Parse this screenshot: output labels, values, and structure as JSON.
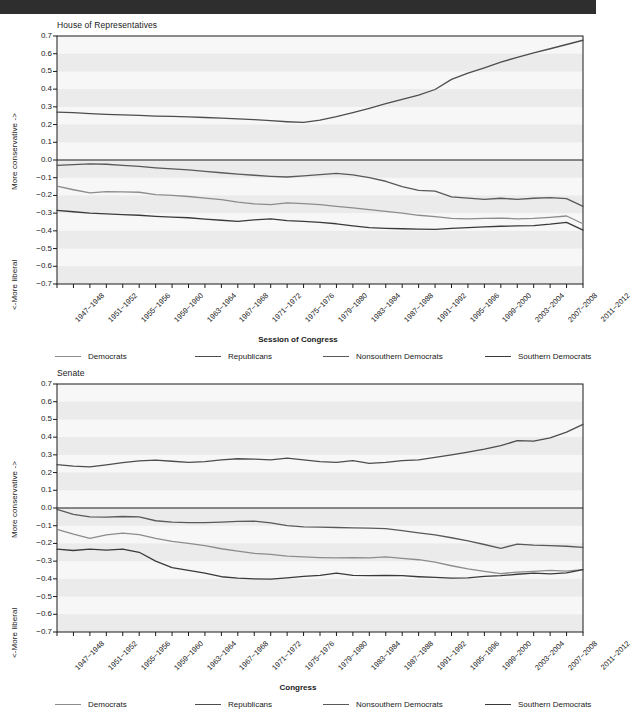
{
  "topbar": {
    "present": true,
    "color": "#2e2e2e"
  },
  "colors": {
    "democrats": "#8c8c8c",
    "republicans": "#4d4d4d",
    "nonsouthern_democrats": "#595959",
    "southern_democrats": "#3a3a3a",
    "axis": "#1a1a1a",
    "band": "#ebebeb",
    "plot_bg": "#f7f7f7"
  },
  "legend": {
    "items": [
      {
        "label": "Democrats",
        "color": "#8c8c8c"
      },
      {
        "label": "Republicans",
        "color": "#4d4d4d"
      },
      {
        "label": "Nonsouthern Democrats",
        "color": "#595959"
      },
      {
        "label": "Southern Democrats",
        "color": "#3a3a3a"
      }
    ]
  },
  "axis_labels": {
    "y_upper": "More conservative ->",
    "y_lower": "<-More liberal",
    "y_ticks": [
      "0.7",
      "0.6",
      "0.5",
      "0.4",
      "0.3",
      "0.2",
      "0.1",
      "0.0",
      "−0.1",
      "−0.2",
      "−0.3",
      "−0.4",
      "−0.5",
      "−0.6",
      "−0.7"
    ]
  },
  "sessions": [
    "1947−1948",
    "1949−1950",
    "1951−1952",
    "1953−1954",
    "1955−1956",
    "1957−1958",
    "1959−1960",
    "1961−1962",
    "1963−1964",
    "1965−1966",
    "1967−1968",
    "1969−1970",
    "1971−1972",
    "1973−1974",
    "1975−1976",
    "1977−1978",
    "1979−1980",
    "1981−1982",
    "1983−1984",
    "1985−1986",
    "1987−1988",
    "1989−1990",
    "1991−1992",
    "1993−1994",
    "1995−1996",
    "1997−1998",
    "1999−2000",
    "2001−2002",
    "2003−2004",
    "2005−2006",
    "2007−2008",
    "2009−2010",
    "2011−2012"
  ],
  "visible_xticks": [
    "1947−1948",
    "1951−1952",
    "1955−1956",
    "1959−1960",
    "1963−1964",
    "1967−1968",
    "1971−1972",
    "1975−1976",
    "1979−1980",
    "1983−1984",
    "1987−1988",
    "1991−1992",
    "1995−1996",
    "1999−2000",
    "2003−2004",
    "2007−2008",
    "2011−2012"
  ],
  "chart_data": [
    {
      "type": "line",
      "title": "House of Representatives",
      "xlabel": "Session of Congress",
      "ylabel": "More conservative -> / <-More liberal",
      "ylim": [
        -0.7,
        0.7
      ],
      "grid": true,
      "legend_position": "bottom",
      "x": [
        "1947−1948",
        "1949−1950",
        "1951−1952",
        "1953−1954",
        "1955−1956",
        "1957−1958",
        "1959−1960",
        "1961−1962",
        "1963−1964",
        "1965−1966",
        "1967−1968",
        "1969−1970",
        "1971−1972",
        "1973−1974",
        "1975−1976",
        "1977−1978",
        "1979−1980",
        "1981−1982",
        "1983−1984",
        "1985−1986",
        "1987−1988",
        "1989−1990",
        "1991−1992",
        "1993−1994",
        "1995−1996",
        "1997−1998",
        "1999−2000",
        "2001−2002",
        "2003−2004",
        "2005−2006",
        "2007−2008",
        "2009−2010",
        "2011−2012"
      ],
      "series": [
        {
          "name": "Republicans",
          "color": "#4d4d4d",
          "values": [
            0.27,
            0.268,
            0.262,
            0.258,
            0.255,
            0.252,
            0.248,
            0.246,
            0.243,
            0.24,
            0.236,
            0.232,
            0.228,
            0.222,
            0.216,
            0.212,
            0.225,
            0.245,
            0.268,
            0.292,
            0.318,
            0.342,
            0.366,
            0.398,
            0.455,
            0.49,
            0.52,
            0.552,
            0.58,
            0.605,
            0.628,
            0.652,
            0.676
          ]
        },
        {
          "name": "Nonsouthern Democrats",
          "color": "#595959",
          "values": [
            -0.03,
            -0.026,
            -0.022,
            -0.024,
            -0.03,
            -0.036,
            -0.044,
            -0.05,
            -0.056,
            -0.064,
            -0.072,
            -0.08,
            -0.086,
            -0.092,
            -0.096,
            -0.09,
            -0.082,
            -0.076,
            -0.084,
            -0.1,
            -0.12,
            -0.15,
            -0.172,
            -0.176,
            -0.208,
            -0.215,
            -0.222,
            -0.216,
            -0.222,
            -0.216,
            -0.212,
            -0.218,
            -0.262
          ]
        },
        {
          "name": "Democrats",
          "color": "#8c8c8c",
          "values": [
            -0.148,
            -0.168,
            -0.186,
            -0.178,
            -0.18,
            -0.182,
            -0.196,
            -0.2,
            -0.206,
            -0.215,
            -0.224,
            -0.238,
            -0.248,
            -0.252,
            -0.242,
            -0.246,
            -0.252,
            -0.262,
            -0.27,
            -0.28,
            -0.29,
            -0.3,
            -0.312,
            -0.32,
            -0.33,
            -0.332,
            -0.33,
            -0.328,
            -0.332,
            -0.33,
            -0.324,
            -0.316,
            -0.36
          ]
        },
        {
          "name": "Southern Democrats",
          "color": "#3a3a3a",
          "values": [
            -0.284,
            -0.292,
            -0.3,
            -0.304,
            -0.308,
            -0.312,
            -0.318,
            -0.322,
            -0.326,
            -0.334,
            -0.34,
            -0.346,
            -0.338,
            -0.332,
            -0.342,
            -0.346,
            -0.352,
            -0.36,
            -0.372,
            -0.382,
            -0.386,
            -0.388,
            -0.39,
            -0.392,
            -0.386,
            -0.382,
            -0.378,
            -0.374,
            -0.372,
            -0.37,
            -0.362,
            -0.352,
            -0.396
          ]
        }
      ]
    },
    {
      "type": "line",
      "title": "Senate",
      "xlabel": "Congress",
      "ylabel": "More conservative -> / <-More liberal",
      "ylim": [
        -0.7,
        0.7
      ],
      "grid": true,
      "legend_position": "bottom",
      "x": [
        "1947−1948",
        "1949−1950",
        "1951−1952",
        "1953−1954",
        "1955−1956",
        "1957−1958",
        "1959−1960",
        "1961−1962",
        "1963−1964",
        "1965−1966",
        "1967−1968",
        "1969−1970",
        "1971−1972",
        "1973−1974",
        "1975−1976",
        "1977−1978",
        "1979−1980",
        "1981−1982",
        "1983−1984",
        "1985−1986",
        "1987−1988",
        "1989−1990",
        "1991−1992",
        "1993−1994",
        "1995−1996",
        "1997−1998",
        "1999−2000",
        "2001−2002",
        "2003−2004",
        "2005−2006",
        "2007−2008",
        "2009−2010",
        "2011−2012"
      ],
      "series": [
        {
          "name": "Republicans",
          "color": "#4d4d4d",
          "values": [
            0.245,
            0.236,
            0.232,
            0.244,
            0.256,
            0.266,
            0.27,
            0.264,
            0.258,
            0.262,
            0.272,
            0.278,
            0.276,
            0.272,
            0.282,
            0.272,
            0.262,
            0.258,
            0.268,
            0.252,
            0.258,
            0.268,
            0.272,
            0.286,
            0.3,
            0.316,
            0.332,
            0.352,
            0.38,
            0.378,
            0.396,
            0.428,
            0.472
          ]
        },
        {
          "name": "Nonsouthern Democrats",
          "color": "#595959",
          "values": [
            -0.008,
            -0.036,
            -0.05,
            -0.052,
            -0.048,
            -0.05,
            -0.072,
            -0.08,
            -0.082,
            -0.082,
            -0.08,
            -0.076,
            -0.074,
            -0.084,
            -0.1,
            -0.106,
            -0.108,
            -0.11,
            -0.112,
            -0.114,
            -0.116,
            -0.128,
            -0.14,
            -0.152,
            -0.168,
            -0.186,
            -0.206,
            -0.228,
            -0.204,
            -0.21,
            -0.212,
            -0.216,
            -0.222
          ]
        },
        {
          "name": "Democrats",
          "color": "#8c8c8c",
          "values": [
            -0.12,
            -0.148,
            -0.172,
            -0.152,
            -0.142,
            -0.15,
            -0.172,
            -0.188,
            -0.2,
            -0.212,
            -0.23,
            -0.244,
            -0.256,
            -0.262,
            -0.272,
            -0.276,
            -0.28,
            -0.282,
            -0.28,
            -0.282,
            -0.276,
            -0.284,
            -0.292,
            -0.306,
            -0.326,
            -0.344,
            -0.358,
            -0.37,
            -0.362,
            -0.358,
            -0.352,
            -0.356,
            -0.348
          ]
        },
        {
          "name": "Southern Democrats",
          "color": "#3a3a3a",
          "values": [
            -0.232,
            -0.24,
            -0.232,
            -0.238,
            -0.232,
            -0.25,
            -0.3,
            -0.336,
            -0.352,
            -0.368,
            -0.388,
            -0.396,
            -0.4,
            -0.402,
            -0.394,
            -0.386,
            -0.38,
            -0.368,
            -0.38,
            -0.382,
            -0.38,
            -0.382,
            -0.388,
            -0.392,
            -0.396,
            -0.394,
            -0.386,
            -0.382,
            -0.374,
            -0.368,
            -0.372,
            -0.366,
            -0.348
          ]
        }
      ]
    }
  ]
}
